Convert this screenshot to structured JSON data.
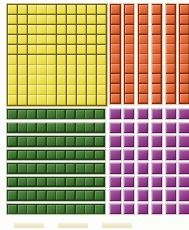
{
  "scene": {
    "title": "Base-ten blocks place-value illustration",
    "background_color": "#fdfdfb",
    "width": 189,
    "height": 230
  },
  "groups": [
    {
      "id": "flat-yellow",
      "name": "hundred-flat",
      "label": "Hundreds flat",
      "color": "#f2e232",
      "grid_line_color": "#6b5a14",
      "shape": "10x10-square",
      "rows": 10,
      "columns": 10,
      "unit_count": 100,
      "piece_count": 1,
      "place_value": "hundreds",
      "value": 100
    },
    {
      "id": "rods-orange",
      "name": "vertical-ten-rods",
      "label": "Tens rods (vertical)",
      "color": "#e8561c",
      "grid_line_color": "#7a2708",
      "shape": "vertical-rod",
      "rods": 6,
      "units_per_rod": 10,
      "unit_count": 60,
      "place_value": "tens",
      "value": 60,
      "clipped_at_right_edge": true
    },
    {
      "id": "rods-green",
      "name": "horizontal-ten-rods",
      "label": "Tens rods (horizontal)",
      "color": "#2e6b1e",
      "grid_line_color": "#1c3b10",
      "shape": "horizontal-rod",
      "rods": 8,
      "units_per_rod": 10,
      "unit_count": 80,
      "place_value": "tens",
      "value": 80
    },
    {
      "id": "units-purple",
      "name": "unit-cubes",
      "label": "Ones cubes",
      "color": "#8a2382",
      "grid_line_color": "#5a1054",
      "shape": "unit-cube-array",
      "rows": 8,
      "columns": 6,
      "unit_count": 48,
      "place_value": "ones",
      "value": 48,
      "clipped_at_right_edge": true,
      "clipped_at_bottom_edge": false
    }
  ],
  "bottom_strip": {
    "name": "cut-off-legend-strip",
    "visible_chips": 3,
    "chip_color": "#d8c98a",
    "note": "partially cropped pale shapes along the bottom edge"
  },
  "cells": {
    "yellow_total": 100,
    "orange_total": 60,
    "green_total": 80,
    "purple_total": 48
  }
}
